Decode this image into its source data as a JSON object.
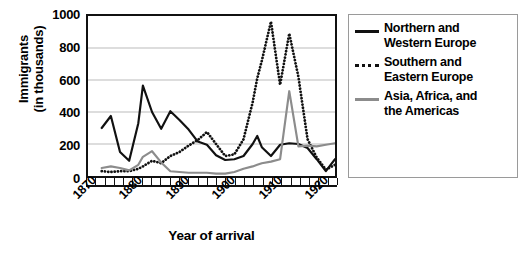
{
  "chart_data": {
    "type": "line",
    "title": "",
    "xlabel": "Year of arrival",
    "ylabel": "Immigrants (in thousands)",
    "ylabel_line1": "Immigrants",
    "ylabel_line2": "(in thousands)",
    "xlim": [
      1870,
      1924
    ],
    "ylim": [
      0,
      1000
    ],
    "yticks": [
      1000,
      800,
      600,
      400,
      200,
      0
    ],
    "xticks": [
      1870,
      1880,
      1890,
      1900,
      1910,
      1920
    ],
    "xtick_minor_step": 2,
    "grid": "horizontal",
    "legend_position": "right",
    "x": [
      1873,
      1875,
      1877,
      1879,
      1881,
      1882,
      1884,
      1886,
      1888,
      1890,
      1892,
      1894,
      1896,
      1898,
      1900,
      1902,
      1904,
      1906,
      1907,
      1908,
      1910,
      1912,
      1914,
      1916,
      1918,
      1920,
      1922,
      1924
    ],
    "series": [
      {
        "name": "Northern and Western Europe",
        "color": "#111111",
        "style": "solid",
        "values": [
          300,
          375,
          150,
          95,
          330,
          565,
          400,
          295,
          405,
          350,
          290,
          215,
          195,
          130,
          100,
          105,
          125,
          200,
          250,
          180,
          125,
          195,
          205,
          200,
          175,
          105,
          30,
          105
        ]
      },
      {
        "name": "Southern and Eastern Europe",
        "color": "#111111",
        "style": "dotted",
        "values": [
          30,
          25,
          30,
          30,
          45,
          60,
          95,
          80,
          125,
          150,
          190,
          225,
          275,
          200,
          125,
          135,
          230,
          460,
          610,
          720,
          965,
          570,
          890,
          620,
          230,
          115,
          40,
          70
        ]
      },
      {
        "name": "Asia, Africa, and the Americas",
        "color": "#8c8c8c",
        "style": "solid",
        "values": [
          50,
          60,
          50,
          35,
          70,
          120,
          155,
          85,
          30,
          25,
          20,
          20,
          20,
          15,
          15,
          25,
          45,
          60,
          70,
          80,
          90,
          105,
          530,
          185,
          190,
          185,
          195,
          205
        ]
      }
    ]
  },
  "legend": {
    "items": [
      {
        "label_line1": "Northern and",
        "label_line2": "Western Europe",
        "swatch": "solid-black"
      },
      {
        "label_line1": "Southern and",
        "label_line2": "Eastern Europe",
        "swatch": "dot-black"
      },
      {
        "label_line1": "Asia, Africa, and",
        "label_line2": "the Americas",
        "swatch": "solid-gray"
      }
    ]
  },
  "axis": {
    "y_tick_labels": [
      "1000",
      "800",
      "600",
      "400",
      "200",
      "0"
    ],
    "x_tick_labels": [
      "1870",
      "1880",
      "1890",
      "1900",
      "1910",
      "1920"
    ]
  }
}
